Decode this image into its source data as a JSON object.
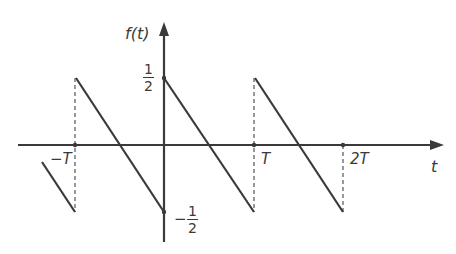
{
  "figure": {
    "colors": {
      "line": "#3a3a3a",
      "dashed": "#555555",
      "background": "#ffffff"
    },
    "axes": {
      "y_label": "f(t)",
      "x_label": "t",
      "x_ticks": [
        {
          "label": "−T",
          "value": "-T"
        },
        {
          "label": "T",
          "value": "T"
        },
        {
          "label": "2T",
          "value": "2T"
        }
      ],
      "y_ticks": [
        {
          "sign": "",
          "num": "1",
          "den": "2",
          "value": 0.5
        },
        {
          "sign": "−",
          "num": "1",
          "den": "2",
          "value": -0.5
        }
      ]
    },
    "labels": {
      "f_t": "f(t)",
      "t": "t",
      "neg_T": "−T",
      "T": "T",
      "two_T": "2T",
      "half_num": "1",
      "half_den": "2",
      "neg_sign": "−",
      "neg_half_num": "1",
      "neg_half_den": "2"
    },
    "segments": [
      {
        "from": [
          "-1.5T",
          -0.0
        ],
        "to": [
          "-T",
          -0.5
        ],
        "note": "partial segment"
      },
      {
        "from": [
          "-T",
          0.5
        ],
        "to": [
          "0",
          -0.5
        ]
      },
      {
        "from": [
          "0",
          0.5
        ],
        "to": [
          "T",
          -0.5
        ]
      },
      {
        "from": [
          "T",
          0.5
        ],
        "to": [
          "2T",
          -0.5
        ]
      }
    ]
  }
}
